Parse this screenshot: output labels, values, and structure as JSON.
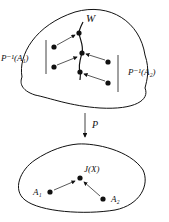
{
  "diagram": {
    "top_region": {
      "curve_label": "W",
      "left_set_label": "P⁻¹(A₁)",
      "right_set_label": "P⁻¹(A₂)"
    },
    "projection_label": "P",
    "bottom_region": {
      "center_point_label": "J(X)",
      "left_point_label": "A₁",
      "right_point_label": "A₂"
    },
    "colors": {
      "ink": "#111111",
      "background": "#ffffff"
    }
  }
}
